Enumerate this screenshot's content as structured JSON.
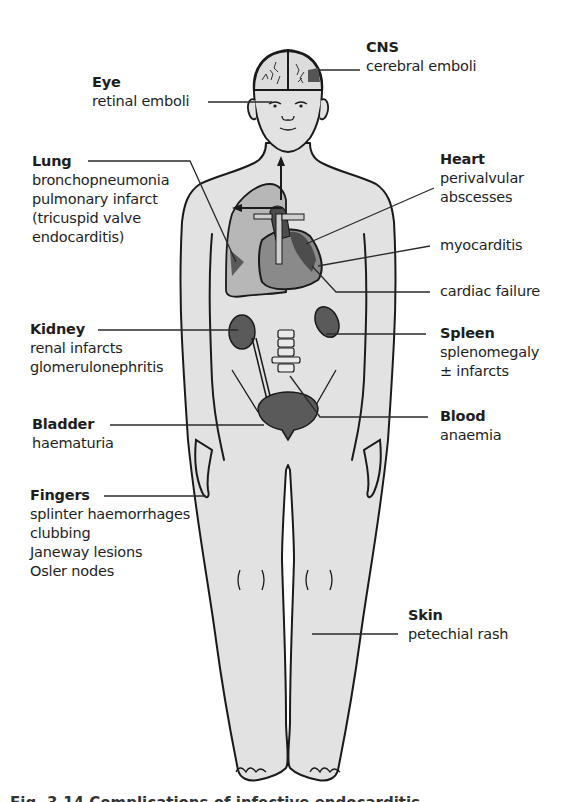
{
  "figure": {
    "type": "anatomical-diagram",
    "colors": {
      "body_fill": "#e2e2e2",
      "lung_fill": "#b7b7b7",
      "organ_dark": "#5a5a5a",
      "heart_dark": "#4d4d4d",
      "outline": "#1a1a1a",
      "leader_line": "#2a2a2a"
    }
  },
  "labels": {
    "cns": {
      "title": "CNS",
      "lines": [
        "cerebral emboli"
      ]
    },
    "eye": {
      "title": "Eye",
      "lines": [
        "retinal emboli"
      ]
    },
    "lung": {
      "title": "Lung",
      "lines": [
        "bronchopneumonia",
        "pulmonary infarct",
        "(tricuspid valve",
        "endocarditis)"
      ]
    },
    "heart": {
      "title": "Heart",
      "lines": [
        "perivalvular",
        "abscesses"
      ]
    },
    "myocarditis": {
      "lines": [
        "myocarditis"
      ]
    },
    "cardiac_failure": {
      "lines": [
        "cardiac failure"
      ]
    },
    "kidney": {
      "title": "Kidney",
      "lines": [
        "renal infarcts",
        "glomerulonephritis"
      ]
    },
    "spleen": {
      "title": "Spleen",
      "lines": [
        "splenomegaly",
        "± infarcts"
      ]
    },
    "bladder": {
      "title": "Bladder",
      "lines": [
        "haematuria"
      ]
    },
    "blood": {
      "title": "Blood",
      "lines": [
        "anaemia"
      ]
    },
    "fingers": {
      "title": "Fingers",
      "lines": [
        "splinter haemorrhages",
        "clubbing",
        "Janeway  lesions",
        "Osler nodes"
      ]
    },
    "skin": {
      "title": "Skin",
      "lines": [
        "petechial rash"
      ]
    }
  },
  "caption": "Fig. 3.14 Complications of infective endocarditis"
}
